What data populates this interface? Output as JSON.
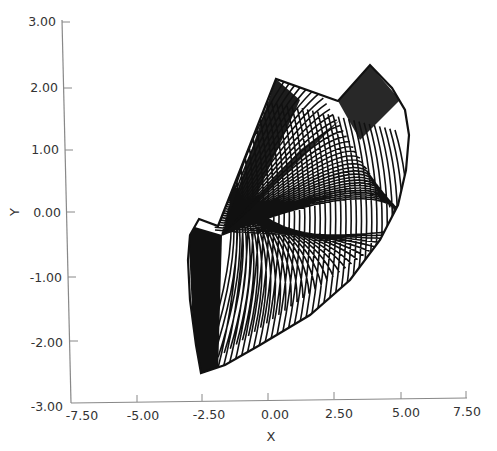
{
  "chart_data": {
    "type": "line",
    "title": "",
    "xlabel": "X",
    "ylabel": "Y",
    "xlim": [
      -7.5,
      7.5
    ],
    "ylim": [
      -3.0,
      3.0
    ],
    "x_ticks": [
      "-7.50",
      "-5.00",
      "-2.50",
      "0.00",
      "2.50",
      "5.00",
      "7.50"
    ],
    "y_ticks": [
      "3.00",
      "2.00",
      "1.00",
      "0.00",
      "-1.00",
      "-2.00",
      "-3.00"
    ],
    "grid": false,
    "legend": null,
    "series": [
      {
        "name": "trajectory envelope",
        "x": [
          -2.6,
          0.3,
          2.65,
          3.9,
          5.3,
          4.9,
          3.5,
          1.5,
          -0.5,
          -2.55,
          -2.7,
          -2.6
        ],
        "y": [
          -0.1,
          2.1,
          1.75,
          2.3,
          1.3,
          0.0,
          -0.9,
          -1.6,
          -2.2,
          -2.55,
          -1.0,
          -0.1
        ]
      }
    ],
    "key_points": [
      {
        "label": "left spike",
        "x": -2.6,
        "y": -0.1
      },
      {
        "label": "upper-left peak",
        "x": 0.3,
        "y": 2.1
      },
      {
        "label": "notch",
        "x": 2.65,
        "y": 1.75
      },
      {
        "label": "right peak",
        "x": 3.9,
        "y": 2.3
      },
      {
        "label": "right extreme",
        "x": 5.3,
        "y": 1.3
      },
      {
        "label": "bottom",
        "x": -2.55,
        "y": -2.55
      },
      {
        "label": "crossing node",
        "x": -1.75,
        "y": -0.35
      }
    ],
    "colors": {
      "line": "#111111",
      "axis": "#888888",
      "background": "#ffffff"
    }
  }
}
